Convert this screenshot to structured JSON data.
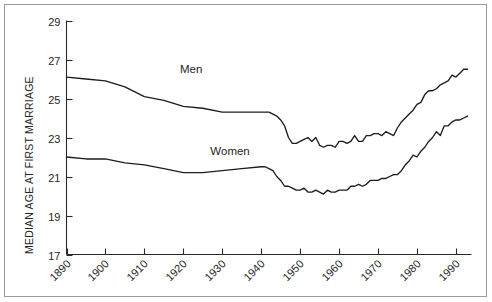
{
  "chart_data": {
    "type": "line",
    "title": "",
    "subtitle": "",
    "xlabel": "",
    "ylabel": "MEDIAN AGE AT FIRST MARRIAGE",
    "xlim": [
      1890,
      1994
    ],
    "ylim": [
      17,
      29
    ],
    "grid": false,
    "legend_position": "inline-annotation",
    "x_ticks": [
      1890,
      1900,
      1910,
      1920,
      1930,
      1940,
      1950,
      1960,
      1970,
      1980,
      1990
    ],
    "x_tick_labels": [
      "1890",
      "1900",
      "1910",
      "1920",
      "1930",
      "1940",
      "1950",
      "1960",
      "1970",
      "1980",
      "1990"
    ],
    "y_ticks": [
      17,
      19,
      21,
      23,
      25,
      27,
      29
    ],
    "y_tick_labels": [
      "17",
      "19",
      "21",
      "23",
      "25",
      "27",
      "29"
    ],
    "annotations": [
      {
        "text": "Men",
        "x": 1922,
        "y": 26.3
      },
      {
        "text": "Women",
        "x": 1932,
        "y": 22.1
      }
    ],
    "series": [
      {
        "name": "Men",
        "label": "Men",
        "color": "#1d1d1d",
        "x": [
          1890,
          1895,
          1900,
          1905,
          1910,
          1915,
          1920,
          1925,
          1930,
          1935,
          1940,
          1941,
          1942,
          1943,
          1944,
          1945,
          1946,
          1947,
          1948,
          1949,
          1950,
          1951,
          1952,
          1953,
          1954,
          1955,
          1956,
          1957,
          1958,
          1959,
          1960,
          1961,
          1962,
          1963,
          1964,
          1965,
          1966,
          1967,
          1968,
          1969,
          1970,
          1971,
          1972,
          1973,
          1974,
          1975,
          1976,
          1977,
          1978,
          1979,
          1980,
          1981,
          1982,
          1983,
          1984,
          1985,
          1986,
          1987,
          1988,
          1989,
          1990,
          1991,
          1992,
          1993
        ],
        "values": [
          26.1,
          26.0,
          25.9,
          25.6,
          25.1,
          24.9,
          24.6,
          24.5,
          24.3,
          24.3,
          24.3,
          24.3,
          24.3,
          24.2,
          24.1,
          23.9,
          23.6,
          23.0,
          22.7,
          22.7,
          22.8,
          22.9,
          23.0,
          22.8,
          23.0,
          22.6,
          22.5,
          22.6,
          22.6,
          22.5,
          22.8,
          22.8,
          22.7,
          22.8,
          23.1,
          22.8,
          22.8,
          23.1,
          23.1,
          23.2,
          23.2,
          23.1,
          23.3,
          23.2,
          23.1,
          23.5,
          23.8,
          24.0,
          24.2,
          24.4,
          24.7,
          24.8,
          25.2,
          25.4,
          25.4,
          25.5,
          25.7,
          25.8,
          25.9,
          26.2,
          26.1,
          26.3,
          26.5,
          26.5
        ]
      },
      {
        "name": "Women",
        "label": "Women",
        "color": "#1d1d1d",
        "x": [
          1890,
          1895,
          1900,
          1905,
          1910,
          1915,
          1920,
          1925,
          1930,
          1935,
          1940,
          1941,
          1942,
          1943,
          1944,
          1945,
          1946,
          1947,
          1948,
          1949,
          1950,
          1951,
          1952,
          1953,
          1954,
          1955,
          1956,
          1957,
          1958,
          1959,
          1960,
          1961,
          1962,
          1963,
          1964,
          1965,
          1966,
          1967,
          1968,
          1969,
          1970,
          1971,
          1972,
          1973,
          1974,
          1975,
          1976,
          1977,
          1978,
          1979,
          1980,
          1981,
          1982,
          1983,
          1984,
          1985,
          1986,
          1987,
          1988,
          1989,
          1990,
          1991,
          1992,
          1993
        ],
        "values": [
          22.0,
          21.9,
          21.9,
          21.7,
          21.6,
          21.4,
          21.2,
          21.2,
          21.3,
          21.4,
          21.5,
          21.5,
          21.4,
          21.3,
          21.0,
          20.8,
          20.5,
          20.5,
          20.4,
          20.3,
          20.3,
          20.4,
          20.2,
          20.2,
          20.3,
          20.2,
          20.1,
          20.3,
          20.2,
          20.2,
          20.3,
          20.3,
          20.3,
          20.5,
          20.5,
          20.6,
          20.5,
          20.6,
          20.8,
          20.8,
          20.8,
          20.9,
          20.9,
          21.0,
          21.1,
          21.1,
          21.3,
          21.6,
          21.8,
          22.1,
          22.0,
          22.3,
          22.5,
          22.8,
          23.0,
          23.3,
          23.1,
          23.6,
          23.6,
          23.8,
          23.9,
          23.9,
          24.0,
          24.1
        ]
      }
    ]
  },
  "axis": {
    "y_title": "MEDIAN AGE AT FIRST MARRIAGE"
  }
}
